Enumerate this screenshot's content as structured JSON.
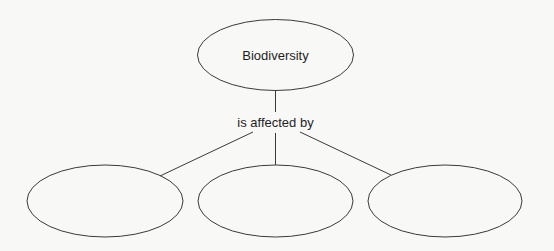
{
  "diagram": {
    "type": "concept-map",
    "root": {
      "label": "Biodiversity"
    },
    "link_label": "is affected by",
    "children": [
      {
        "label": ""
      },
      {
        "label": ""
      },
      {
        "label": ""
      }
    ],
    "colors": {
      "background": "#f8f8f7",
      "stroke": "#3a3a3a",
      "text": "#1e1e1e"
    }
  }
}
